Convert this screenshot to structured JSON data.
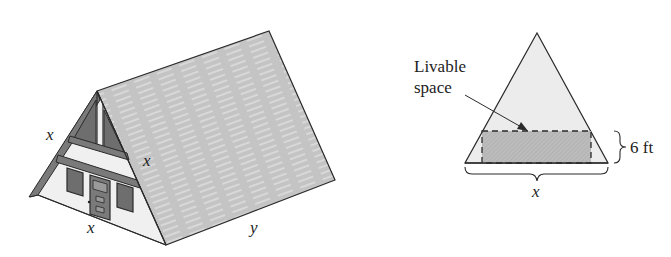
{
  "house_figure": {
    "labels": {
      "front_left_edge": "x",
      "front_right_edge": "x",
      "front_base": "x",
      "side_length": "y"
    },
    "colors": {
      "roof": "#c4c4c4",
      "roof_stripes": "#ececec",
      "gable_wall": "#f0f0f0",
      "trim": "#7a7a7a",
      "window": "#6e6e6e",
      "outline": "#2a2a2a"
    }
  },
  "cross_section": {
    "callout_line1": "Livable",
    "callout_line2": "space",
    "height_label": "6 ft",
    "base_label": "x",
    "colors": {
      "triangle_fill": "#ececec",
      "livable_fill": "#bdbdbd",
      "outline": "#2a2a2a"
    }
  }
}
